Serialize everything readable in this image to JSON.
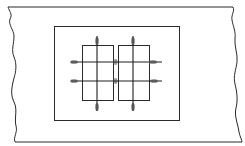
{
  "diagram": {
    "type": "technical-drawing",
    "background": "#ffffff",
    "stroke_color": "#2a2a2a",
    "marker_color": "#8a8a8a",
    "outer_strip": {
      "top_y": 7,
      "bottom_y": 142,
      "left_edge": "broken-wavy",
      "right_edge": "broken-wavy"
    },
    "inner_frame": {
      "x": 54,
      "y": 26,
      "width": 125,
      "height": 94
    },
    "panels": [
      {
        "id": "left-panel",
        "x": 82,
        "y": 45,
        "width": 31,
        "height": 55
      },
      {
        "id": "right-panel",
        "x": 118,
        "y": 45,
        "width": 31,
        "height": 55
      }
    ],
    "vertical_lines": [
      {
        "x": 97,
        "y1": 36,
        "y2": 111
      },
      {
        "x": 133,
        "y1": 36,
        "y2": 111
      }
    ],
    "horizontal_lines": [
      {
        "y": 62,
        "x1": 71,
        "x2": 162
      },
      {
        "y": 81,
        "x1": 71,
        "x2": 162
      }
    ],
    "markers": [
      {
        "cx": 97,
        "cy": 41,
        "rx": 2,
        "ry": 4
      },
      {
        "cx": 133,
        "cy": 41,
        "rx": 2,
        "ry": 4
      },
      {
        "cx": 97,
        "cy": 107,
        "rx": 2,
        "ry": 4
      },
      {
        "cx": 133,
        "cy": 107,
        "rx": 2,
        "ry": 4
      },
      {
        "cx": 74,
        "cy": 62,
        "rx": 4,
        "ry": 2
      },
      {
        "cx": 74,
        "cy": 81,
        "rx": 4,
        "ry": 2
      },
      {
        "cx": 153,
        "cy": 62,
        "rx": 4,
        "ry": 2
      },
      {
        "cx": 154,
        "cy": 81,
        "rx": 4,
        "ry": 2
      },
      {
        "cx": 115,
        "cy": 62,
        "rx": 2,
        "ry": 3
      },
      {
        "cx": 115,
        "cy": 81,
        "rx": 2,
        "ry": 3
      }
    ]
  }
}
